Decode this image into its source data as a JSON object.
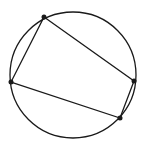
{
  "figure": {
    "background": "#ffffff",
    "stroke": "#1a1a1a",
    "circle": {
      "cx": 73,
      "cy": 75,
      "r": 63
    },
    "points": [
      {
        "name": "A",
        "x": 44,
        "y": 17
      },
      {
        "name": "B",
        "x": 134,
        "y": 81
      },
      {
        "name": "C",
        "x": 120,
        "y": 118
      },
      {
        "name": "D",
        "x": 11,
        "y": 82
      }
    ],
    "polygon": "44,17 134,81 120,118 11,82"
  }
}
